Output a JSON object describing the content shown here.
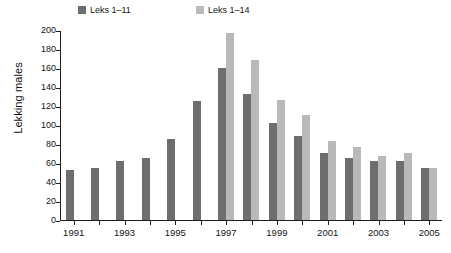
{
  "chart_data": {
    "type": "bar",
    "title": "",
    "xlabel": "",
    "ylabel": "Lekking males",
    "ylim": [
      0,
      200
    ],
    "yticks": [
      0,
      20,
      40,
      60,
      80,
      100,
      120,
      140,
      160,
      180,
      200
    ],
    "grid": false,
    "legend_position": "top",
    "categories": [
      "1991",
      "1992",
      "1993",
      "1994",
      "1995",
      "1996",
      "1997",
      "1998",
      "1999",
      "2000",
      "2001",
      "2002",
      "2003",
      "2004",
      "2005"
    ],
    "xtick_labels": [
      "1991",
      "1993",
      "1995",
      "1997",
      "1999",
      "2001",
      "2003",
      "2005"
    ],
    "series": [
      {
        "name": "Leks 1–11",
        "color": "#6e6e6e",
        "values": [
          53,
          55,
          62,
          66,
          86,
          126,
          161,
          133,
          103,
          89,
          71,
          66,
          62,
          62,
          55
        ]
      },
      {
        "name": "Leks 1–14",
        "color": "#b9b9b9",
        "values": [
          null,
          null,
          null,
          null,
          null,
          null,
          198,
          169,
          127,
          111,
          84,
          77,
          68,
          71,
          55
        ]
      }
    ]
  },
  "legend": {
    "items": [
      {
        "label": "Leks 1–11",
        "color": "#6e6e6e"
      },
      {
        "label": "Leks 1–14",
        "color": "#b9b9b9"
      }
    ]
  },
  "axes": {
    "y_title": "Lekking males",
    "y_tick_labels": [
      "200",
      "180",
      "160",
      "140",
      "120",
      "100",
      "80",
      "60",
      "40",
      "20",
      "0"
    ],
    "x_tick_labels": [
      "1991",
      "1993",
      "1995",
      "1997",
      "1999",
      "2001",
      "2003",
      "2005"
    ]
  }
}
